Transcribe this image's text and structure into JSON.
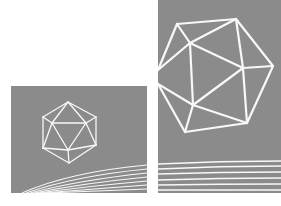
{
  "canvas": {
    "width": 281,
    "height": 206,
    "background": "#ffffff"
  },
  "colors": {
    "panel": "#8b8b8b",
    "line": "#f8f8f8"
  },
  "panels": [
    {
      "name": "small-panel",
      "x": 11,
      "y": 86,
      "width": 136,
      "height": 107
    },
    {
      "name": "large-panel",
      "x": 158,
      "y": 0,
      "width": 123,
      "height": 193
    }
  ],
  "icosahedra": [
    {
      "name": "small-icosahedron",
      "stroke_width": 1.3,
      "vertices": {
        "top": [
          68,
          102
        ],
        "ul": [
          43,
          117
        ],
        "ur": [
          96,
          117
        ],
        "il": [
          52,
          123
        ],
        "ir": [
          86,
          123
        ],
        "ll": [
          43,
          148
        ],
        "lr": [
          96,
          145
        ],
        "ib": [
          68,
          150
        ],
        "bot": [
          69,
          163
        ]
      },
      "edges": [
        [
          "top",
          "ul"
        ],
        [
          "top",
          "ur"
        ],
        [
          "top",
          "il"
        ],
        [
          "top",
          "ir"
        ],
        [
          "ul",
          "il"
        ],
        [
          "ur",
          "ir"
        ],
        [
          "il",
          "ir"
        ],
        [
          "ul",
          "ll"
        ],
        [
          "ur",
          "lr"
        ],
        [
          "il",
          "ll"
        ],
        [
          "il",
          "ib"
        ],
        [
          "ir",
          "ib"
        ],
        [
          "ir",
          "lr"
        ],
        [
          "ll",
          "ib"
        ],
        [
          "lr",
          "ib"
        ],
        [
          "ll",
          "bot"
        ],
        [
          "lr",
          "bot"
        ],
        [
          "ib",
          "bot"
        ]
      ]
    },
    {
      "name": "large-icosahedron",
      "stroke_width": 2.2,
      "vertices": {
        "A": [
          177,
          24
        ],
        "B": [
          236,
          19
        ],
        "C": [
          190,
          43
        ],
        "D": [
          273,
          66
        ],
        "E": [
          243,
          68
        ],
        "F": [
          158,
          70
        ],
        "G": [
          158,
          84
        ],
        "H": [
          193,
          105
        ],
        "I": [
          247,
          123
        ],
        "J": [
          185,
          132
        ]
      },
      "edges": [
        [
          "A",
          "B"
        ],
        [
          "A",
          "C"
        ],
        [
          "A",
          "F"
        ],
        [
          "B",
          "C"
        ],
        [
          "B",
          "E"
        ],
        [
          "B",
          "D"
        ],
        [
          "C",
          "E"
        ],
        [
          "C",
          "F"
        ],
        [
          "C",
          "H"
        ],
        [
          "E",
          "D"
        ],
        [
          "E",
          "H"
        ],
        [
          "E",
          "I"
        ],
        [
          "D",
          "I"
        ],
        [
          "G",
          "H"
        ],
        [
          "G",
          "J"
        ],
        [
          "H",
          "I"
        ],
        [
          "H",
          "J"
        ],
        [
          "J",
          "I"
        ]
      ]
    }
  ],
  "curves": {
    "small": [
      "M22,193 Q70,172 147,165",
      "M26,193 Q75,176 147,169",
      "M30,193 Q80,180 147,173",
      "M34,193 Q85,183 147,177",
      "M38,193 Q90,186 147,181",
      "M42,193 Q95,189 147,185",
      "M46,193 Q100,191 147,189"
    ],
    "large": [
      "M158,164 Q220,161 281,161",
      "M158,169 Q220,166 281,166",
      "M158,174 Q220,172 281,172",
      "M158,180 Q220,178 281,178",
      "M158,185 Q220,184 281,184",
      "M158,190 Q220,190 281,190"
    ]
  }
}
